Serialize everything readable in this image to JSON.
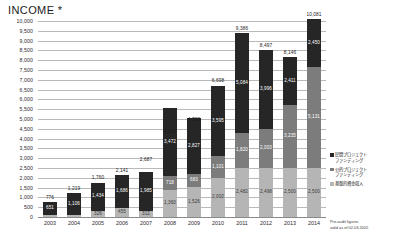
{
  "chart_data": {
    "type": "bar",
    "stacked": true,
    "title": "INCOME *",
    "xlabel": "",
    "ylabel": "",
    "ylim": [
      0,
      10000
    ],
    "ytick_step": 500,
    "grid": true,
    "legend_position": "right",
    "categories": [
      "2003",
      "2004",
      "2005",
      "2006",
      "2007",
      "2008",
      "2009",
      "2010",
      "2011",
      "2012",
      "2013",
      "2014"
    ],
    "ytick_labels": [
      "10,000",
      "9,500",
      "9,000",
      "8,500",
      "8,000",
      "7,500",
      "7,000",
      "6,500",
      "6,000",
      "5,500",
      "5,000",
      "4,500",
      "4,000",
      "3,500",
      "3,000",
      "2,500",
      "2,000",
      "1,500",
      "1,000",
      "500",
      "0"
    ],
    "series": [
      {
        "name": "民間プロジェクト\nファンディング",
        "color": "#262626",
        "values": [
          651,
          1106,
          1434,
          1686,
          1985,
          3472,
          2827,
          3595,
          5084,
          3996,
          2411,
          2450
        ],
        "value_labels": [
          "651",
          "1,106",
          "1,434",
          "1,686",
          "1,985",
          "3,472",
          "2,827",
          "3,595",
          "5,084",
          "3,996",
          "2,411",
          "2,450"
        ]
      },
      {
        "name": "公的プロジェクト\nファンディング",
        "color": "#7c7c7c",
        "values": [
          0,
          0,
          0,
          0,
          0,
          718,
          683,
          1101,
          1820,
          2003,
          3235,
          5131
        ],
        "value_labels": [
          "",
          "",
          "",
          "",
          "",
          "718",
          "683",
          "1,101",
          "1,820",
          "2,003",
          "3,235",
          "5,131"
        ]
      },
      {
        "name": "基盤的資金収入",
        "color": "#b5b5b5",
        "values": [
          125,
          113,
          326,
          455,
          312,
          1360,
          1526,
          2002,
          2482,
          2498,
          2500,
          2500
        ],
        "value_labels": [
          "125",
          "113",
          "326",
          "455",
          "312",
          "1,360",
          "1,526",
          "2,002",
          "2,482",
          "2,498",
          "2,500",
          "2,500"
        ]
      }
    ],
    "totals": [
      776,
      1219,
      1760,
      2141,
      2687,
      4136,
      4730,
      6698,
      9386,
      8497,
      8146,
      10081
    ],
    "total_labels": [
      "776",
      "1,219",
      "1,760",
      "2,141",
      "2,687",
      "4,136",
      "4,730",
      "6,698",
      "9,386",
      "8,497",
      "8,146",
      "10,081"
    ],
    "annotations": {
      "footnote_line1": "Pre-audit figures",
      "footnote_line2": "valid as of 02.03.2005"
    }
  },
  "legend": {
    "items": [
      {
        "label_line1": "民間プロジェクト",
        "label_line2": "ファンディング",
        "color": "#262626"
      },
      {
        "label_line1": "公的プロジェクト",
        "label_line2": "ファンディング",
        "color": "#7c7c7c"
      },
      {
        "label_line1": "基盤的資金収入",
        "label_line2": "",
        "color": "#b5b5b5"
      }
    ]
  },
  "colors": {
    "private_funding": "#262626",
    "public_funding": "#7c7c7c",
    "base_income": "#b5b5b5",
    "gridline": "#b9b9b9",
    "text": "#1a1a1a",
    "background": "#ffffff"
  }
}
